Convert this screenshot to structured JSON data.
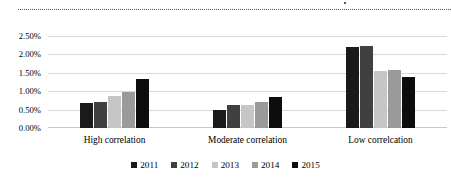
{
  "chart_data": {
    "type": "bar",
    "title": "",
    "subtitle": "",
    "xlabel": "",
    "ylabel": "",
    "ylim": [
      0,
      2.5
    ],
    "ytick_labels": [
      "2.50%",
      "2.00%",
      "1.50%",
      "1.00%",
      "0.50%",
      "0.00%"
    ],
    "ytick_values": [
      2.5,
      2.0,
      1.5,
      1.0,
      0.5,
      0.0
    ],
    "grid": "horizontal",
    "legend_position": "bottom",
    "value_unit": "%",
    "categories": [
      "High correlation",
      "Moderate correlation",
      "Low correlcation"
    ],
    "series": [
      {
        "name": "2011",
        "color": "#1a1a1a",
        "values": [
          0.68,
          0.5,
          2.19
        ]
      },
      {
        "name": "2012",
        "color": "#404040",
        "values": [
          0.72,
          0.63,
          2.24
        ]
      },
      {
        "name": "2013",
        "color": "#c6c6c6",
        "values": [
          0.86,
          0.63,
          1.56
        ]
      },
      {
        "name": "2014",
        "color": "#9a9a9a",
        "values": [
          0.97,
          0.72,
          1.59
        ]
      },
      {
        "name": "2015",
        "color": "#0d0d0d",
        "values": [
          1.32,
          0.85,
          1.38
        ]
      }
    ]
  },
  "legend": {
    "items": [
      {
        "label": "2011"
      },
      {
        "label": "2012"
      },
      {
        "label": "2013"
      },
      {
        "label": "2014"
      },
      {
        "label": "2015"
      }
    ]
  },
  "decor": {
    "marquee": "dotted-selection-line"
  }
}
